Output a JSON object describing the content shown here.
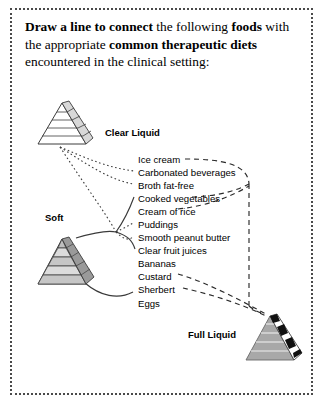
{
  "prompt": {
    "bold_1": "Draw a line to connect",
    "text_1": " the following ",
    "bold_2": "foods",
    "text_2": " with the appropriate ",
    "bold_3": "common therapeutic diets",
    "text_3": " encountered in the clinical setting:"
  },
  "diets": [
    {
      "id": "clear-liquid",
      "label": "Clear Liquid",
      "style": "white-layered"
    },
    {
      "id": "soft",
      "label": "Soft",
      "style": "gray-layered"
    },
    {
      "id": "full-liquid",
      "label": "Full Liquid",
      "style": "dark-checkered"
    }
  ],
  "foods": [
    {
      "label": "Ice cream"
    },
    {
      "label": "Carbonated beverages"
    },
    {
      "label": "Broth fat-free"
    },
    {
      "label": "Cooked vegetables"
    },
    {
      "label": "Cream of rice"
    },
    {
      "label": "Puddings"
    },
    {
      "label": "Smooth peanut butter"
    },
    {
      "label": "Clear fruit juices"
    },
    {
      "label": "Bananas"
    },
    {
      "label": "Custard"
    },
    {
      "label": "Sherbert"
    },
    {
      "label": "Eggs"
    }
  ],
  "colors": {
    "border": "#4a4a4a",
    "text": "#000000",
    "connector_dotted": "#3a3a3a",
    "connector_dashed": "#2a2a2a",
    "pyramid_light": "#ffffff",
    "pyramid_gray": "#c9c9c9",
    "pyramid_dark": "#8f8f8f",
    "pyramid_stroke": "#3c3c3c"
  }
}
